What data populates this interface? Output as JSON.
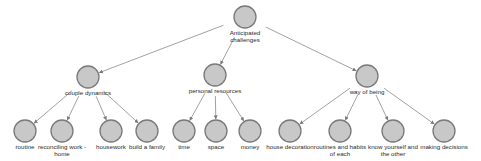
{
  "diagram": {
    "type": "tree",
    "colors": {
      "node_fill": "#c8c8c8",
      "node_stroke": "#7a7a7a",
      "edge": "#8a8a8a",
      "text": "#2a2a2a"
    },
    "root": {
      "id": "root",
      "label_lines": [
        "Anticipated",
        "challenges"
      ],
      "x": 245,
      "y": 17
    },
    "categories": [
      {
        "id": "couple",
        "label_lines": [
          "couple dynamics"
        ],
        "x": 88,
        "y": 77,
        "children": [
          {
            "id": "routine",
            "label_lines": [
              "routine"
            ],
            "x": 25,
            "y": 131
          },
          {
            "id": "reconciling",
            "label_lines": [
              "reconciling work -",
              "home"
            ],
            "x": 62,
            "y": 131
          },
          {
            "id": "housework",
            "label_lines": [
              "housework"
            ],
            "x": 111,
            "y": 131
          },
          {
            "id": "family",
            "label_lines": [
              "build a family"
            ],
            "x": 147,
            "y": 131
          }
        ]
      },
      {
        "id": "personal",
        "label_lines": [
          "personal resources"
        ],
        "x": 215,
        "y": 75,
        "children": [
          {
            "id": "time",
            "label_lines": [
              "time"
            ],
            "x": 184,
            "y": 131
          },
          {
            "id": "space",
            "label_lines": [
              "space"
            ],
            "x": 216,
            "y": 131
          },
          {
            "id": "money",
            "label_lines": [
              "money"
            ],
            "x": 250,
            "y": 131
          }
        ]
      },
      {
        "id": "being",
        "label_lines": [
          "way of being"
        ],
        "x": 367,
        "y": 76,
        "children": [
          {
            "id": "decoration",
            "label_lines": [
              "house decoration"
            ],
            "x": 290,
            "y": 131
          },
          {
            "id": "routines",
            "label_lines": [
              "routines and habits",
              "of each"
            ],
            "x": 340,
            "y": 131
          },
          {
            "id": "know",
            "label_lines": [
              "know yourself and",
              "the other"
            ],
            "x": 393,
            "y": 131
          },
          {
            "id": "decisions",
            "label_lines": [
              "making decisions"
            ],
            "x": 444,
            "y": 131
          }
        ]
      }
    ]
  }
}
